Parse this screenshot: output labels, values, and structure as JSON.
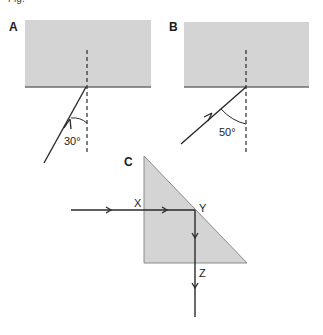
{
  "header": {
    "partial_text": "Fig."
  },
  "panels": {
    "A": {
      "label": "A",
      "angle_label": "30°"
    },
    "B": {
      "label": "B",
      "angle_label": "50°"
    },
    "C": {
      "label": "C",
      "points": {
        "x": "X",
        "y": "Y",
        "z": "Z"
      }
    }
  },
  "colors": {
    "medium_fill": "#d4d4d4",
    "line": "#2a2a2a",
    "surface_line": "#6e6e6e"
  }
}
